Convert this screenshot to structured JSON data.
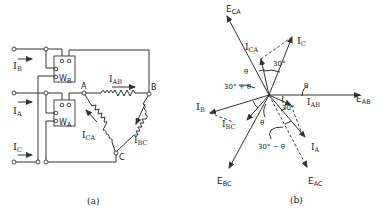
{
  "panel_a": {
    "caption": "(a)",
    "line_currents": [
      {
        "main": "I",
        "sub": "B"
      },
      {
        "main": "I",
        "sub": "A"
      },
      {
        "main": "I",
        "sub": "C"
      }
    ],
    "wattmeters": [
      {
        "main": "W",
        "sub": "B"
      },
      {
        "main": "W",
        "sub": "A"
      }
    ],
    "nodes": [
      "A",
      "B",
      "C"
    ],
    "phase_currents": [
      {
        "main": "I",
        "sub": "AB"
      },
      {
        "main": "I",
        "sub": "CA"
      },
      {
        "main": "I",
        "sub": "BC"
      }
    ]
  },
  "panel_b": {
    "caption": "(b)",
    "voltages": [
      {
        "main": "E",
        "sub": "CA"
      },
      {
        "main": "E",
        "sub": "AB"
      },
      {
        "main": "E",
        "sub": "BC"
      },
      {
        "main": "E",
        "sub": "AC"
      }
    ],
    "currents": [
      {
        "main": "I",
        "sub": "C"
      },
      {
        "main": "I",
        "sub": "CA"
      },
      {
        "main": "I",
        "sub": "B"
      },
      {
        "main": "I",
        "sub": "BC"
      },
      {
        "main": "I",
        "sub": "AB"
      },
      {
        "main": "I",
        "sub": "A"
      }
    ],
    "angles": {
      "theta": "θ",
      "a30": "30°",
      "a30_plus_theta": "30° + θ",
      "a30_minus_theta": "30° − θ"
    }
  }
}
